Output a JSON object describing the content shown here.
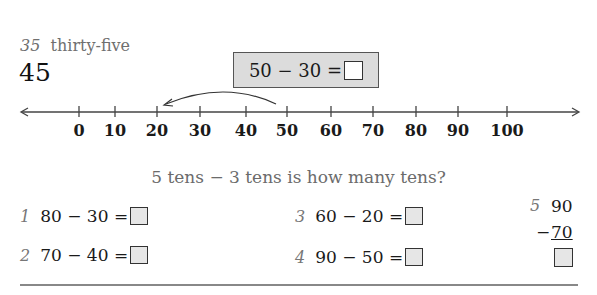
{
  "header": {
    "page_number": "35",
    "page_word": "thirty-five",
    "lesson_number": "45"
  },
  "example": {
    "equation": "50 − 30 =",
    "answer": ""
  },
  "number_line": {
    "ticks": [
      {
        "label": "0",
        "x": 79
      },
      {
        "label": "10",
        "x": 115
      },
      {
        "label": "20",
        "x": 157
      },
      {
        "label": "30",
        "x": 200
      },
      {
        "label": "40",
        "x": 246
      },
      {
        "label": "50",
        "x": 287
      },
      {
        "label": "60",
        "x": 331
      },
      {
        "label": "70",
        "x": 373
      },
      {
        "label": "80",
        "x": 416
      },
      {
        "label": "90",
        "x": 458
      },
      {
        "label": "100",
        "x": 507
      }
    ],
    "jump": {
      "from": "50",
      "to": "20"
    }
  },
  "question": "5 tens − 3 tens is how many tens?",
  "problems": [
    {
      "index": "1",
      "expr": "80 − 30 =",
      "answer": ""
    },
    {
      "index": "2",
      "expr": "70 − 40 =",
      "answer": ""
    },
    {
      "index": "3",
      "expr": "60 − 20 =",
      "answer": ""
    },
    {
      "index": "4",
      "expr": "90 − 50 =",
      "answer": ""
    }
  ],
  "vertical_problem": {
    "index": "5",
    "top": "90",
    "operator": "−",
    "bottom": "70",
    "answer": ""
  }
}
